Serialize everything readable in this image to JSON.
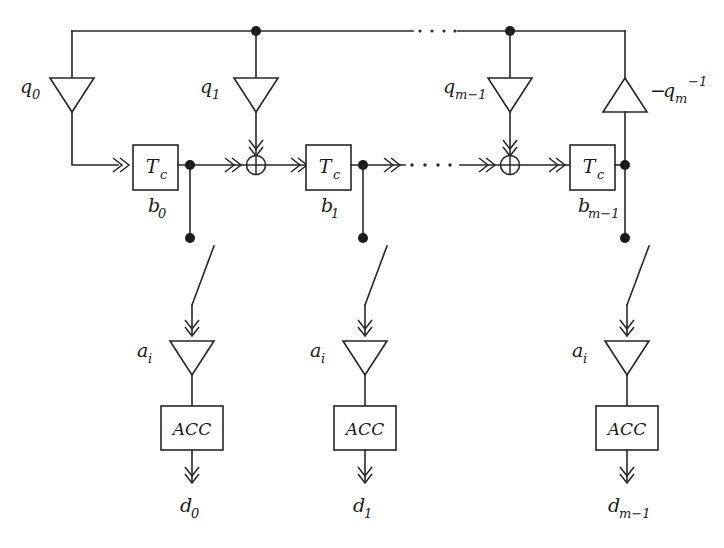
{
  "figure": {
    "type": "block-diagram",
    "domain": "digital-signal-processing",
    "background_color": "#ffffff",
    "line_color": "#262626"
  },
  "top_bus": {
    "label": "feedback-bus",
    "ellipsis": "· · · ·",
    "junction_count": 2
  },
  "tap_gains": [
    {
      "id": "q0",
      "label": "q",
      "sub": "0",
      "sup": "",
      "direction": "down"
    },
    {
      "id": "q1",
      "label": "q",
      "sub": "1",
      "sup": "",
      "direction": "down"
    },
    {
      "id": "qm1",
      "label": "q",
      "sub": "m−1",
      "sup": "",
      "direction": "down"
    },
    {
      "id": "qm",
      "label": "q",
      "sub": "m",
      "sup": "−1",
      "prefix": "−",
      "direction": "up"
    }
  ],
  "delay_stages": [
    {
      "id": "stage0",
      "box_label": "T",
      "box_sub": "c",
      "state_label": "b",
      "state_sub": "0"
    },
    {
      "id": "stage1",
      "box_label": "T",
      "box_sub": "c",
      "state_label": "b",
      "state_sub": "1"
    },
    {
      "id": "stage_m1",
      "box_label": "T",
      "box_sub": "c",
      "state_label": "b",
      "state_sub": "m−1"
    }
  ],
  "adders": [
    {
      "id": "xor1",
      "symbol": "⊕",
      "name": "modulo-2-adder"
    },
    {
      "id": "xor2",
      "symbol": "⊕",
      "name": "modulo-2-adder"
    }
  ],
  "signal_chain": {
    "ellipsis": "· · · ·",
    "arrow_style": "double-chevron"
  },
  "output_branches": [
    {
      "id": "branch0",
      "gain_label": "a",
      "gain_sub": "i",
      "accumulator_label": "ACC",
      "output_label": "d",
      "output_sub": "0",
      "switch": "open-switch"
    },
    {
      "id": "branch1",
      "gain_label": "a",
      "gain_sub": "i",
      "accumulator_label": "ACC",
      "output_label": "d",
      "output_sub": "1",
      "switch": "open-switch"
    },
    {
      "id": "branch_m1",
      "gain_label": "a",
      "gain_sub": "i",
      "accumulator_label": "ACC",
      "output_label": "d",
      "output_sub": "m−1",
      "switch": "open-switch"
    }
  ]
}
